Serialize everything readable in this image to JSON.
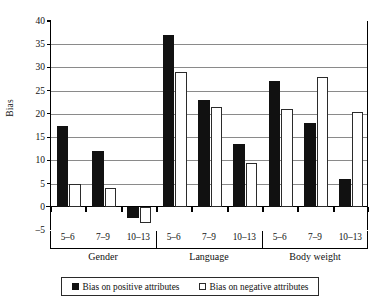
{
  "chart_data": {
    "type": "bar",
    "title": "",
    "xlabel": "",
    "ylabel": "Bias",
    "ylim": [
      -5,
      40
    ],
    "yticks": [
      -5,
      0,
      5,
      10,
      15,
      20,
      25,
      30,
      35,
      40
    ],
    "grid": true,
    "legend_position": "bottom",
    "groups": [
      {
        "label": "Gender"
      },
      {
        "label": "Language"
      },
      {
        "label": "Body weight"
      }
    ],
    "categories": [
      "5–6",
      "7–9",
      "10–13",
      "5–6",
      "7–9",
      "10–13",
      "5–6",
      "7–9",
      "10–13"
    ],
    "series": [
      {
        "name": "Bias on positive attributes",
        "color": "#111111",
        "style": "filled",
        "values": [
          17.5,
          12.0,
          -2.5,
          37.0,
          23.0,
          13.5,
          27.0,
          18.0,
          6.0
        ]
      },
      {
        "name": "Bias on negative attributes",
        "color": "#ffffff",
        "style": "hollow",
        "values": [
          5.0,
          4.0,
          -3.5,
          29.0,
          21.5,
          9.5,
          21.0,
          28.0,
          20.5
        ]
      }
    ]
  },
  "axis": {
    "y_title": "Bias",
    "y_tick_labels": [
      "40",
      "35",
      "30",
      "25",
      "20",
      "15",
      "10",
      "5",
      "0",
      "–5"
    ]
  },
  "legend": {
    "entries": [
      {
        "label": "Bias on positive attributes"
      },
      {
        "label": "Bias on negative attributes"
      }
    ]
  }
}
